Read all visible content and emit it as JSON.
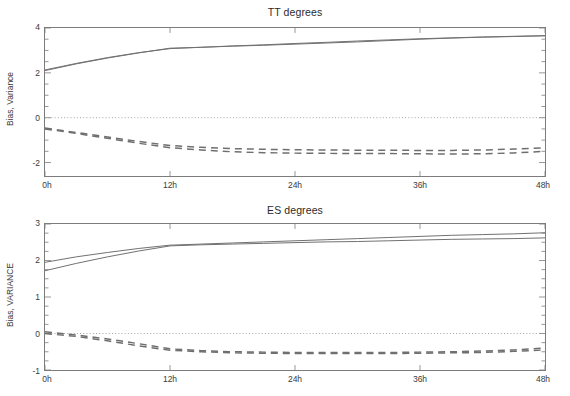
{
  "figure": {
    "width": 570,
    "height": 396,
    "background": "#ffffff",
    "line_color": "#6f6f6f",
    "axis_color": "#7c7c7c",
    "zero_line_color": "#9a9a9a"
  },
  "chart_data": [
    {
      "type": "line",
      "title": "TT degrees",
      "xlabel": "",
      "ylabel": "Bias, Variance",
      "x": [
        0,
        3,
        6,
        9,
        12,
        15,
        18,
        21,
        24,
        27,
        30,
        33,
        36,
        39,
        42,
        45,
        48
      ],
      "xtick_labels": [
        "0h",
        "12h",
        "24h",
        "36h",
        "48h"
      ],
      "xtick_values": [
        0,
        12,
        24,
        36,
        48
      ],
      "ytick_labels": [
        "4",
        "2",
        "0",
        "-2"
      ],
      "ytick_values": [
        4,
        2,
        0,
        -2
      ],
      "ylim": [
        -2.6,
        4.0
      ],
      "xlim": [
        0,
        48
      ],
      "grid": false,
      "zero_line": true,
      "legend": "none",
      "series": [
        {
          "name": "Variance run 1",
          "style": "solid",
          "values": [
            2.13,
            2.42,
            2.68,
            2.9,
            3.08,
            3.14,
            3.2,
            3.25,
            3.31,
            3.36,
            3.42,
            3.47,
            3.52,
            3.56,
            3.6,
            3.63,
            3.66
          ]
        },
        {
          "name": "Variance run 2",
          "style": "solid",
          "values": [
            2.1,
            2.4,
            2.66,
            2.89,
            3.1,
            3.14,
            3.19,
            3.23,
            3.28,
            3.33,
            3.38,
            3.44,
            3.5,
            3.55,
            3.59,
            3.62,
            3.65
          ]
        },
        {
          "name": "Bias run 1",
          "style": "dashed",
          "values": [
            -0.46,
            -0.66,
            -0.86,
            -1.06,
            -1.24,
            -1.32,
            -1.38,
            -1.41,
            -1.43,
            -1.44,
            -1.45,
            -1.45,
            -1.46,
            -1.46,
            -1.44,
            -1.4,
            -1.34
          ]
        },
        {
          "name": "Bias run 2",
          "style": "dashed",
          "values": [
            -0.5,
            -0.7,
            -0.92,
            -1.14,
            -1.34,
            -1.44,
            -1.52,
            -1.56,
            -1.58,
            -1.59,
            -1.6,
            -1.6,
            -1.61,
            -1.62,
            -1.61,
            -1.57,
            -1.5
          ]
        }
      ]
    },
    {
      "type": "line",
      "title": "ES degrees",
      "xlabel": "",
      "ylabel": "Bias, VARIANCE",
      "x": [
        0,
        3,
        6,
        9,
        12,
        15,
        18,
        21,
        24,
        27,
        30,
        33,
        36,
        39,
        42,
        45,
        48
      ],
      "xtick_labels": [
        "0h",
        "12h",
        "24h",
        "36h",
        "48h"
      ],
      "xtick_values": [
        0,
        12,
        24,
        36,
        48
      ],
      "ytick_labels": [
        "3",
        "2",
        "1",
        "0",
        "-1"
      ],
      "ytick_values": [
        3,
        2,
        1,
        0,
        -1
      ],
      "ylim": [
        -1.0,
        3.0
      ],
      "xlim": [
        0,
        48
      ],
      "grid": false,
      "zero_line": true,
      "legend": "none",
      "series": [
        {
          "name": "VARIANCE run 1",
          "style": "solid",
          "values": [
            1.95,
            2.1,
            2.22,
            2.33,
            2.42,
            2.45,
            2.48,
            2.51,
            2.54,
            2.57,
            2.6,
            2.63,
            2.66,
            2.69,
            2.71,
            2.73,
            2.76
          ]
        },
        {
          "name": "VARIANCE run 2",
          "style": "solid",
          "values": [
            1.72,
            1.92,
            2.1,
            2.26,
            2.4,
            2.43,
            2.45,
            2.47,
            2.49,
            2.51,
            2.52,
            2.54,
            2.56,
            2.58,
            2.59,
            2.6,
            2.62
          ]
        },
        {
          "name": "Bias run 1",
          "style": "dashed",
          "values": [
            0.05,
            -0.04,
            -0.15,
            -0.28,
            -0.42,
            -0.47,
            -0.5,
            -0.51,
            -0.52,
            -0.52,
            -0.52,
            -0.52,
            -0.51,
            -0.5,
            -0.48,
            -0.45,
            -0.4
          ]
        },
        {
          "name": "Bias run 2",
          "style": "dashed",
          "values": [
            0.0,
            -0.08,
            -0.2,
            -0.34,
            -0.46,
            -0.5,
            -0.53,
            -0.54,
            -0.55,
            -0.55,
            -0.55,
            -0.55,
            -0.54,
            -0.53,
            -0.52,
            -0.49,
            -0.45
          ]
        }
      ]
    }
  ]
}
